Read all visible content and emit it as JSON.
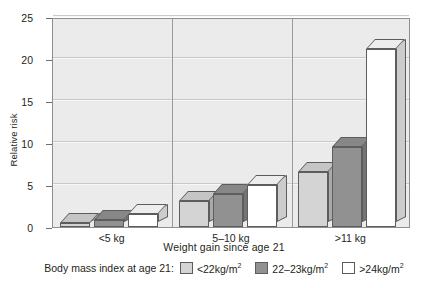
{
  "chart_data": {
    "type": "bar",
    "title": "",
    "xlabel": "Weight gain since age 21",
    "ylabel": "Relative risk",
    "ylim": [
      0,
      25
    ],
    "yticks": [
      0,
      5,
      10,
      15,
      20,
      25
    ],
    "grid": true,
    "legend_position": "bottom",
    "legend_title": "Body mass index at age 21:",
    "categories": [
      "<5 kg",
      "5–10 kg",
      ">11 kg"
    ],
    "series": [
      {
        "name": "<22kg/m2",
        "values": [
          0.5,
          3.1,
          6.5
        ],
        "color": "#d4d4d4"
      },
      {
        "name": "22–23kg/m2",
        "values": [
          0.8,
          3.9,
          9.5
        ],
        "color": "#919191"
      },
      {
        "name": ">24kg/m2",
        "values": [
          1.5,
          5.0,
          21.2
        ],
        "color": "#ffffff"
      }
    ]
  },
  "axes": {
    "y_label": "Relative risk",
    "x_label": "Weight gain since age 21",
    "y_ticks": [
      "0",
      "5",
      "10",
      "15",
      "20",
      "25"
    ],
    "x_group_labels": [
      "<5 kg",
      "5–10 kg",
      ">11 kg"
    ]
  },
  "legend": {
    "title": "Body mass index at age 21:",
    "items": [
      {
        "label_pre": "<22kg/m",
        "label_sup": "2",
        "swatch_color": "#d4d4d4"
      },
      {
        "label_pre": "22–23kg/m",
        "label_sup": "2",
        "swatch_color": "#919191"
      },
      {
        "label_pre": ">24kg/m",
        "label_sup": "2",
        "swatch_color": "#ffffff"
      }
    ]
  },
  "style": {
    "plot_background": "#ebebeb",
    "frame_color": "#8e8e8e",
    "gridline_color": "#c9c9c9",
    "bar_outline": "#5d5d5d"
  }
}
